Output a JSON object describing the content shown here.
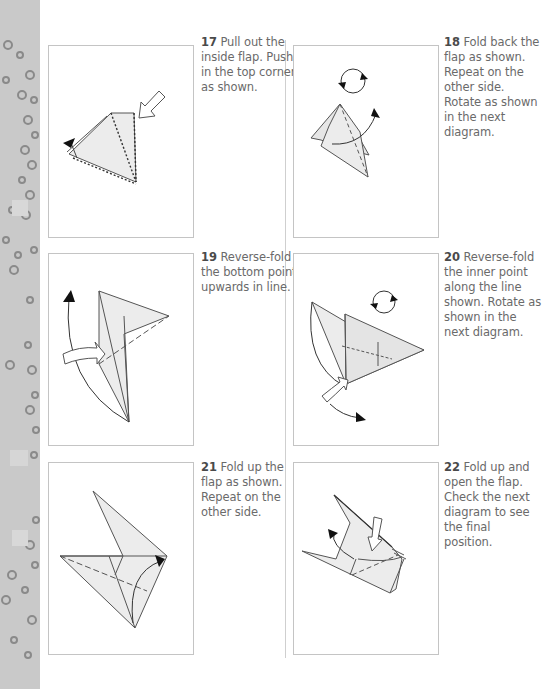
{
  "page": {
    "background": "#ffffff",
    "strip_color": "#c9c9c9",
    "panel_border": "#c4c4c4",
    "text_color": "#6a6a6a",
    "number_color": "#4a4a4a"
  },
  "steps": [
    {
      "number": "17",
      "text": "Pull out the inside flap. Push in the top corner as shown."
    },
    {
      "number": "18",
      "text": "Fold back the flap as shown. Repeat on the other side. Rotate as shown in the next diagram."
    },
    {
      "number": "19",
      "text": "Reverse-fold the bottom point upwards in line."
    },
    {
      "number": "20",
      "text": "Reverse-fold the inner point along the line shown. Rotate as shown in the next diagram."
    },
    {
      "number": "21",
      "text": "Fold up the flap as shown. Repeat on the other side."
    },
    {
      "number": "22",
      "text": "Fold up and open the flap. Check the next diagram to see the final position."
    }
  ]
}
